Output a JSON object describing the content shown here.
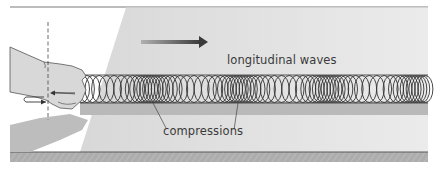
{
  "diagram": {
    "labels": {
      "waves": "longitudinal waves",
      "compressions": "compressions"
    },
    "elements": {
      "direction_arrow": "arrow-right-icon",
      "hand": "hand-icon",
      "spring": "spring-coil",
      "push_pull_arrow": "back-and-forth-arrow-icon",
      "reference_line": "dashed-vertical-line"
    },
    "colors": {
      "background": "#ffffff",
      "shade": "#e4e4e4",
      "band": "#b8b8b8",
      "floor": "#a9a9a9",
      "coil": "#3a3a3a",
      "hand": "#d6d6d6",
      "text": "#3a3a3a"
    }
  }
}
